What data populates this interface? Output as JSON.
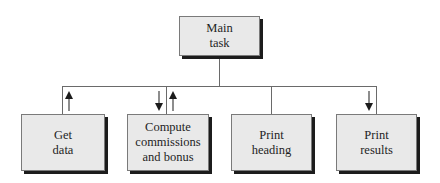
{
  "diagram": {
    "type": "structure-chart",
    "colors": {
      "box_fill": "#e9e9e9",
      "box_border": "#7a7a7a",
      "shadow": "#1c1c1c",
      "line": "#6a6a6a",
      "text": "#1e1e1e"
    },
    "root": {
      "label": "Main\ntask"
    },
    "children": [
      {
        "label": "Get\ndata",
        "arrows": [
          "up"
        ]
      },
      {
        "label": "Compute\ncommissions\nand bonus",
        "arrows": [
          "down",
          "up"
        ]
      },
      {
        "label": "Print\nheading",
        "arrows": []
      },
      {
        "label": "Print\nresults",
        "arrows": [
          "down"
        ]
      }
    ]
  }
}
